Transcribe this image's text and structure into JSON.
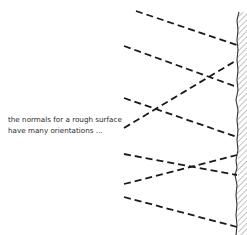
{
  "diagram": {
    "caption_line1": "the normals for a rough surface",
    "caption_line2": "have many orientations ...",
    "colors": {
      "line": "#1a1a1a",
      "surface": "#333333",
      "hatch": "#9a9a9a",
      "background": "#ffffff"
    },
    "normals": [
      {
        "x1": 136,
        "y1": 11,
        "x2": 237,
        "y2": 45
      },
      {
        "x1": 124,
        "y1": 46,
        "x2": 237,
        "y2": 87
      },
      {
        "x1": 124,
        "y1": 98,
        "x2": 237,
        "y2": 137
      },
      {
        "x1": 124,
        "y1": 128,
        "x2": 237,
        "y2": 60
      },
      {
        "x1": 124,
        "y1": 154,
        "x2": 237,
        "y2": 175
      },
      {
        "x1": 124,
        "y1": 184,
        "x2": 237,
        "y2": 155
      },
      {
        "x1": 124,
        "y1": 197,
        "x2": 237,
        "y2": 227
      }
    ]
  }
}
